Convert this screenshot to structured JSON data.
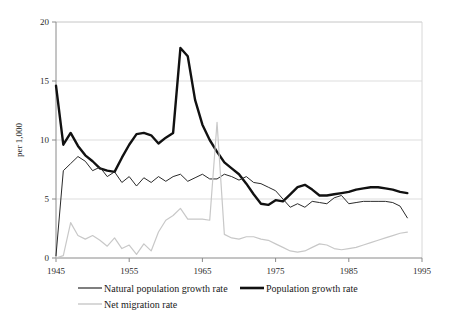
{
  "chart_data": {
    "type": "line",
    "title": "",
    "subtitle": "",
    "xlabel": "",
    "ylabel": "per 1,000",
    "xlim": [
      1945,
      1995
    ],
    "ylim": [
      0,
      20
    ],
    "grid": true,
    "grid_axis": "y",
    "legend_position": "bottom-left",
    "x_ticks": [
      "1945",
      "1955",
      "1965",
      "1975",
      "1985",
      "1995"
    ],
    "x_tick_values": [
      1945,
      1955,
      1965,
      1975,
      1985,
      1995
    ],
    "y_ticks": [
      "0",
      "5",
      "10",
      "15",
      "20"
    ],
    "y_tick_values": [
      0,
      5,
      10,
      15,
      20
    ],
    "x": [
      1945,
      1946,
      1947,
      1948,
      1949,
      1950,
      1951,
      1952,
      1953,
      1954,
      1955,
      1956,
      1957,
      1958,
      1959,
      1960,
      1961,
      1962,
      1963,
      1964,
      1965,
      1966,
      1967,
      1968,
      1969,
      1970,
      1971,
      1972,
      1973,
      1974,
      1975,
      1976,
      1977,
      1978,
      1979,
      1980,
      1981,
      1982,
      1983,
      1984,
      1985,
      1986,
      1987,
      1988,
      1989,
      1990,
      1991,
      1992,
      1993
    ],
    "series": [
      {
        "name": "Population growth rate",
        "color": "#111111",
        "width": 2.4,
        "values": [
          14.6,
          9.6,
          10.6,
          9.5,
          8.7,
          8.2,
          7.6,
          7.4,
          7.3,
          8.5,
          9.6,
          10.5,
          10.6,
          10.4,
          9.7,
          10.2,
          10.6,
          17.8,
          17.1,
          13.4,
          11.3,
          10.0,
          9.0,
          8.1,
          7.6,
          7.1,
          6.3,
          5.4,
          4.6,
          4.5,
          4.9,
          4.8,
          5.4,
          6.0,
          6.2,
          5.8,
          5.3,
          5.3,
          5.4,
          5.5,
          5.6,
          5.8,
          5.9,
          6.0,
          6.0,
          5.9,
          5.8,
          5.6,
          5.5
        ]
      },
      {
        "name": "Natural population growth rate",
        "color": "#2a2a2a",
        "width": 1.0,
        "values": [
          0.2,
          7.4,
          8.0,
          8.6,
          8.2,
          7.4,
          7.7,
          6.9,
          7.3,
          6.4,
          6.9,
          6.1,
          6.8,
          6.4,
          6.9,
          6.5,
          6.9,
          7.1,
          6.5,
          6.8,
          7.1,
          6.7,
          6.7,
          7.1,
          6.9,
          6.6,
          6.9,
          6.4,
          6.3,
          6.0,
          5.7,
          5.0,
          4.3,
          4.6,
          4.3,
          4.8,
          4.7,
          4.6,
          5.1,
          5.3,
          4.6,
          4.7,
          4.8,
          4.8,
          4.8,
          4.8,
          4.7,
          4.4,
          3.4
        ]
      },
      {
        "name": "Net migration rate",
        "color": "#c8c8c8",
        "width": 1.2,
        "values": [
          0.0,
          0.2,
          3.0,
          1.9,
          1.6,
          1.9,
          1.5,
          1.0,
          1.7,
          0.8,
          1.1,
          0.3,
          1.2,
          0.6,
          2.2,
          3.2,
          3.6,
          4.2,
          3.3,
          3.3,
          3.3,
          3.2,
          11.5,
          2.0,
          1.7,
          1.6,
          1.8,
          1.8,
          1.6,
          1.5,
          1.2,
          0.9,
          0.6,
          0.5,
          0.6,
          0.9,
          1.2,
          1.1,
          0.8,
          0.7,
          0.8,
          0.9,
          1.1,
          1.3,
          1.5,
          1.7,
          1.9,
          2.1,
          2.2
        ]
      }
    ]
  },
  "legend": {
    "items": [
      {
        "label": "Natural population growth rate",
        "color": "#2a2a2a",
        "width": 1.2
      },
      {
        "label": "Population growth rate",
        "color": "#111111",
        "width": 2.6
      },
      {
        "label": "Net migration rate",
        "color": "#c8c8c8",
        "width": 1.4
      }
    ]
  },
  "axes": {
    "y_title": "per 1,000",
    "axis_color": "#8a8a8a",
    "grid_color": "#d4d4d4",
    "background": "#ffffff"
  }
}
